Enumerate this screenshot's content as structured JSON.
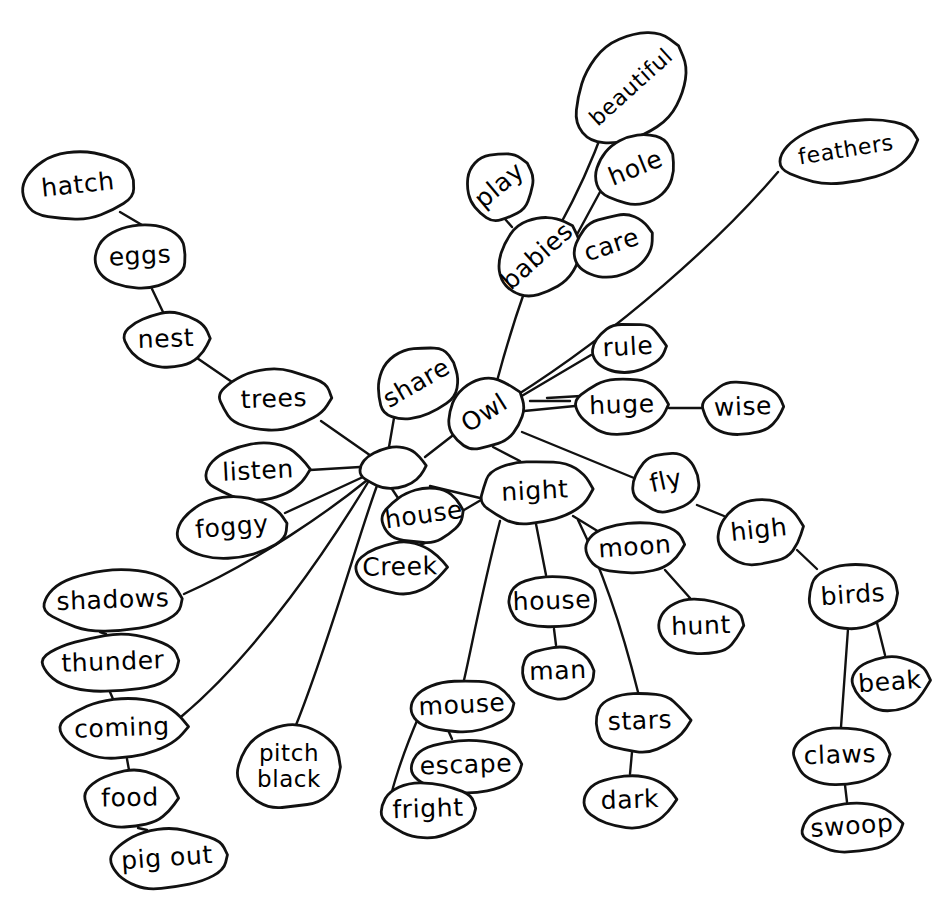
{
  "diagram": {
    "style": {
      "background": "#ffffff",
      "ink": "#111111",
      "bubble_fill": "#ffffff"
    },
    "hub": {
      "label": "",
      "name": "central-hub-node",
      "cx": 393,
      "cy": 468,
      "rx": 33,
      "ry": 21,
      "rot": -4
    },
    "nodes": [
      {
        "id": "hatch",
        "label": "hatch",
        "cx": 78,
        "cy": 186,
        "rx": 58,
        "ry": 34,
        "rot": -6
      },
      {
        "id": "eggs",
        "label": "eggs",
        "cx": 140,
        "cy": 257,
        "rx": 48,
        "ry": 32,
        "rot": -3
      },
      {
        "id": "nest",
        "label": "nest",
        "cx": 166,
        "cy": 340,
        "rx": 42,
        "ry": 28,
        "rot": -2
      },
      {
        "id": "trees",
        "label": "trees",
        "cx": 274,
        "cy": 400,
        "rx": 56,
        "ry": 31,
        "rot": -2
      },
      {
        "id": "listen",
        "label": "listen",
        "cx": 258,
        "cy": 472,
        "rx": 52,
        "ry": 29,
        "rot": -3
      },
      {
        "id": "foggy",
        "label": "foggy",
        "cx": 232,
        "cy": 528,
        "rx": 56,
        "ry": 31,
        "rot": -5
      },
      {
        "id": "shadows",
        "label": "shadows",
        "cx": 113,
        "cy": 601,
        "rx": 72,
        "ry": 31,
        "rot": -2
      },
      {
        "id": "thunder",
        "label": "thunder",
        "cx": 113,
        "cy": 663,
        "rx": 70,
        "ry": 29,
        "rot": -2
      },
      {
        "id": "coming",
        "label": "coming",
        "cx": 122,
        "cy": 729,
        "rx": 63,
        "ry": 30,
        "rot": -2
      },
      {
        "id": "food",
        "label": "food",
        "cx": 130,
        "cy": 799,
        "rx": 47,
        "ry": 29,
        "rot": -1
      },
      {
        "id": "pigout",
        "label": "pig out",
        "cx": 167,
        "cy": 859,
        "rx": 60,
        "ry": 30,
        "rot": -4
      },
      {
        "id": "pitchblack",
        "label": "pitch black",
        "cx": 289,
        "cy": 767,
        "rx": 52,
        "ry": 42,
        "rot": 0,
        "lines": [
          "pitch",
          "black"
        ]
      },
      {
        "id": "share",
        "label": "share",
        "cx": 417,
        "cy": 384,
        "rx": 44,
        "ry": 35,
        "rot": -30
      },
      {
        "id": "house1",
        "label": "house",
        "cx": 424,
        "cy": 516,
        "rx": 42,
        "ry": 27,
        "rot": -8
      },
      {
        "id": "creek",
        "label": "Creek",
        "cx": 400,
        "cy": 568,
        "rx": 45,
        "ry": 26,
        "rot": -1
      },
      {
        "id": "owl",
        "label": "Owl",
        "cx": 485,
        "cy": 414,
        "rx": 40,
        "ry": 33,
        "rot": -32
      },
      {
        "id": "babies",
        "label": "babies",
        "cx": 538,
        "cy": 257,
        "rx": 46,
        "ry": 36,
        "rot": -42
      },
      {
        "id": "play",
        "label": "play",
        "cx": 500,
        "cy": 186,
        "rx": 36,
        "ry": 33,
        "rot": -40
      },
      {
        "id": "beautiful",
        "label": "beautiful",
        "cx": 632,
        "cy": 88,
        "rx": 65,
        "ry": 47,
        "rot": -42
      },
      {
        "id": "hole",
        "label": "hole",
        "cx": 636,
        "cy": 169,
        "rx": 42,
        "ry": 36,
        "rot": -22
      },
      {
        "id": "care",
        "label": "care",
        "cx": 612,
        "cy": 246,
        "rx": 40,
        "ry": 31,
        "rot": -18
      },
      {
        "id": "feathers",
        "label": "feathers",
        "cx": 846,
        "cy": 151,
        "rx": 70,
        "ry": 32,
        "rot": -9
      },
      {
        "id": "rule",
        "label": "rule",
        "cx": 628,
        "cy": 348,
        "rx": 38,
        "ry": 25,
        "rot": -3
      },
      {
        "id": "huge",
        "label": "huge",
        "cx": 622,
        "cy": 406,
        "rx": 47,
        "ry": 29,
        "rot": -2
      },
      {
        "id": "wise",
        "label": "wise",
        "cx": 743,
        "cy": 408,
        "rx": 42,
        "ry": 27,
        "rot": -2
      },
      {
        "id": "fly",
        "label": "fly",
        "cx": 666,
        "cy": 482,
        "rx": 34,
        "ry": 30,
        "rot": -12
      },
      {
        "id": "high",
        "label": "high",
        "cx": 759,
        "cy": 531,
        "rx": 42,
        "ry": 34,
        "rot": -6
      },
      {
        "id": "night",
        "label": "night",
        "cx": 535,
        "cy": 492,
        "rx": 56,
        "ry": 32,
        "rot": -3
      },
      {
        "id": "moon",
        "label": "moon",
        "cx": 635,
        "cy": 548,
        "rx": 49,
        "ry": 27,
        "rot": -4
      },
      {
        "id": "hunt",
        "label": "hunt",
        "cx": 701,
        "cy": 627,
        "rx": 43,
        "ry": 29,
        "rot": -2
      },
      {
        "id": "house2",
        "label": "house",
        "cx": 552,
        "cy": 602,
        "rx": 45,
        "ry": 27,
        "rot": -2
      },
      {
        "id": "man",
        "label": "man",
        "cx": 558,
        "cy": 672,
        "rx": 38,
        "ry": 27,
        "rot": -2
      },
      {
        "id": "stars",
        "label": "stars",
        "cx": 640,
        "cy": 722,
        "rx": 48,
        "ry": 30,
        "rot": -2
      },
      {
        "id": "dark",
        "label": "dark",
        "cx": 630,
        "cy": 801,
        "rx": 45,
        "ry": 27,
        "rot": -2
      },
      {
        "id": "mouse",
        "label": "mouse",
        "cx": 462,
        "cy": 706,
        "rx": 51,
        "ry": 26,
        "rot": -3
      },
      {
        "id": "escape",
        "label": "escape",
        "cx": 466,
        "cy": 766,
        "rx": 56,
        "ry": 27,
        "rot": -2
      },
      {
        "id": "fright",
        "label": "fright",
        "cx": 428,
        "cy": 810,
        "rx": 49,
        "ry": 28,
        "rot": -2
      },
      {
        "id": "birds",
        "label": "birds",
        "cx": 853,
        "cy": 596,
        "rx": 47,
        "ry": 33,
        "rot": -4
      },
      {
        "id": "beak",
        "label": "beak",
        "cx": 890,
        "cy": 683,
        "rx": 38,
        "ry": 28,
        "rot": -4
      },
      {
        "id": "claws",
        "label": "claws",
        "cx": 840,
        "cy": 756,
        "rx": 48,
        "ry": 29,
        "rot": -2
      },
      {
        "id": "swoop",
        "label": "swoop",
        "cx": 852,
        "cy": 827,
        "rx": 50,
        "ry": 25,
        "rot": -4
      }
    ],
    "edges": [
      {
        "from": "hatch",
        "to": "eggs",
        "path": "M 120 212 L 142 225"
      },
      {
        "from": "eggs",
        "to": "nest",
        "path": "M 152 289 L 163 312"
      },
      {
        "from": "nest",
        "to": "trees",
        "path": "M 197 358 L 232 382"
      },
      {
        "from": "trees",
        "to": "hub",
        "path": "M 321 421 L 374 458"
      },
      {
        "from": "listen",
        "to": "hub",
        "path": "M 310 470 L 360 467"
      },
      {
        "from": "foggy",
        "to": "hub",
        "path": "M 285 513 L 363 477"
      },
      {
        "from": "shadows",
        "to": "hub",
        "path": "M 184 594 C 260 560 330 510 366 481"
      },
      {
        "from": "coming",
        "to": "hub",
        "path": "M 182 716 C 260 650 330 545 370 479"
      },
      {
        "from": "shadows",
        "to": "thunder",
        "path": "M 100 632 L 106 634"
      },
      {
        "from": "thunder",
        "to": "coming",
        "path": "M 110 692 L 113 699"
      },
      {
        "from": "coming",
        "to": "food",
        "path": "M 127 759 L 129 770"
      },
      {
        "from": "food",
        "to": "pigout",
        "path": "M 138 828 L 147 830"
      },
      {
        "from": "pitchblack",
        "to": "hub",
        "path": "M 296 725 C 330 640 360 530 378 483"
      },
      {
        "from": "share",
        "to": "hub",
        "path": "M 394 418 L 389 447"
      },
      {
        "from": "house1",
        "to": "hub",
        "path": "M 400 501 L 388 483"
      },
      {
        "from": "creek",
        "to": "house1",
        "path": "M 419 545 L 425 543"
      },
      {
        "from": "owl",
        "to": "hub",
        "path": "M 452 436 L 425 457"
      },
      {
        "from": "owl",
        "to": "babies",
        "path": "M 497 381 C 508 340 518 310 524 293"
      },
      {
        "from": "babies",
        "to": "play",
        "path": "M 512 227 L 505 219"
      },
      {
        "from": "babies",
        "to": "beautiful",
        "path": "M 560 225 C 582 185 596 150 604 128"
      },
      {
        "from": "babies",
        "to": "hole",
        "path": "M 574 240 L 600 192"
      },
      {
        "from": "babies",
        "to": "care",
        "path": "M 577 258 L 573 252"
      },
      {
        "from": "owl",
        "to": "feathers",
        "path": "M 514 397 C 620 330 720 240 778 172"
      },
      {
        "from": "owl",
        "to": "rule",
        "path": "M 520 397 L 591 355"
      },
      {
        "from": "owl",
        "to": "dash",
        "path": "M 530 401 L 570 401"
      },
      {
        "from": "owl",
        "to": "huge",
        "path": "M 524 411 L 575 406"
      },
      {
        "from": "huge",
        "to": "wise",
        "path": "M 669 408 L 701 408"
      },
      {
        "from": "owl",
        "to": "fly",
        "path": "M 522 432 C 570 452 615 470 634 478"
      },
      {
        "from": "fly",
        "to": "high",
        "path": "M 697 505 L 724 516"
      },
      {
        "from": "high",
        "to": "birds",
        "path": "M 797 550 L 817 569"
      },
      {
        "from": "birds",
        "to": "beak",
        "path": "M 877 623 L 885 655"
      },
      {
        "from": "birds",
        "to": "claws",
        "path": "M 848 629 L 841 727"
      },
      {
        "from": "claws",
        "to": "swoop",
        "path": "M 845 785 L 847 802"
      },
      {
        "from": "owl",
        "to": "night",
        "path": "M 493 447 L 520 461"
      },
      {
        "from": "night",
        "to": "hub",
        "path": "M 480 498 L 430 486"
      },
      {
        "from": "night",
        "to": "moon",
        "path": "M 573 516 C 596 530 612 540 620 545"
      },
      {
        "from": "moon",
        "to": "hunt",
        "path": "M 665 570 L 690 598"
      },
      {
        "from": "night",
        "to": "house2",
        "path": "M 536 524 L 546 575"
      },
      {
        "from": "house2",
        "to": "man",
        "path": "M 554 629 L 556 645"
      },
      {
        "from": "night",
        "to": "stars",
        "path": "M 578 520 C 610 585 630 660 638 692"
      },
      {
        "from": "stars",
        "to": "dark",
        "path": "M 632 752 L 630 774"
      },
      {
        "from": "night",
        "to": "mouse",
        "path": "M 500 521 C 482 590 470 655 464 680"
      },
      {
        "from": "mouse",
        "to": "escape",
        "path": "M 448 730 L 452 739"
      },
      {
        "from": "mouse",
        "to": "fright",
        "path": "M 419 716 C 400 760 392 790 390 800"
      },
      {
        "from": "house1",
        "to": "night",
        "path": "M 464 510 L 481 500"
      }
    ],
    "dash_mark": {
      "name": "owl-huge-dash",
      "x1": 547,
      "y1": 398,
      "x2": 581,
      "y2": 396
    }
  }
}
